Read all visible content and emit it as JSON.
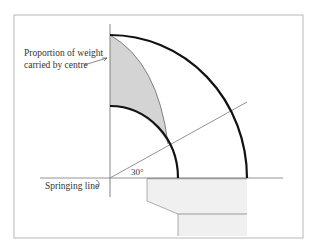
{
  "diagram": {
    "labels": {
      "proportion_line1": "Proportion of weight",
      "proportion_line2": "carried by centre",
      "springing_line": "Springing line",
      "angle": "30°"
    },
    "colors": {
      "frame": "#b8b8b8",
      "arch": "#111111",
      "shaded_region": "#d4d4d4",
      "thin_line": "#777777",
      "abutment_fill": "#f0f0f0",
      "abutment_edge": "#999999"
    },
    "geometry": {
      "origin": [
        110,
        178
      ],
      "inner_radius": 70,
      "outer_radius": 140,
      "angle_degrees": 30
    }
  }
}
